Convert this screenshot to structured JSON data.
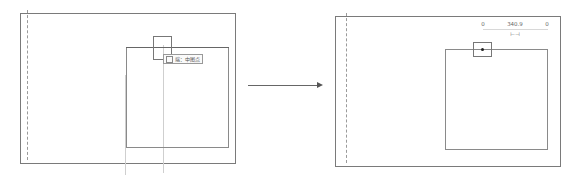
{
  "diagram": {
    "type": "before-after",
    "panels": [
      {
        "id": "before",
        "tooltip": {
          "text": "端：中图点",
          "icon": "endpoint-snap-icon"
        },
        "elements": [
          "outer-frame",
          "dashed-vertical-line",
          "inner-rectangle",
          "snap-box",
          "tooltip",
          "vertical-guides"
        ]
      },
      {
        "id": "after",
        "dimension": {
          "left_value": "0",
          "center_value": "340.9",
          "right_value": "0",
          "symbol": "⊢⊣"
        },
        "elements": [
          "outer-frame",
          "dashed-vertical-line",
          "inner-rectangle",
          "snap-box-with-point",
          "dimension-labels"
        ]
      }
    ],
    "arrow": {
      "direction": "right",
      "meaning": "transforms-to"
    },
    "colors": {
      "frame": "#7a7a7a",
      "inner": "#8a8a8a",
      "dashed": "#9a9a9a",
      "guide": "#cfcfcf",
      "arrow": "#666666",
      "background": "#ffffff"
    }
  }
}
